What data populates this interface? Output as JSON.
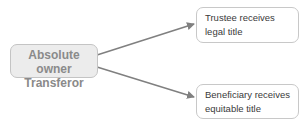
{
  "diagram": {
    "source": {
      "line1": "Absolute owner",
      "line2": "Transferor"
    },
    "targets": [
      {
        "line1": "Trustee receives",
        "line2": "legal title"
      },
      {
        "line1": "Beneficiary receives",
        "line2": "equitable title"
      }
    ],
    "colors": {
      "source_fill": "#ececec",
      "source_text": "#8a8a8a",
      "arrow": "#808080",
      "box_border": "#c8c8c8"
    }
  }
}
